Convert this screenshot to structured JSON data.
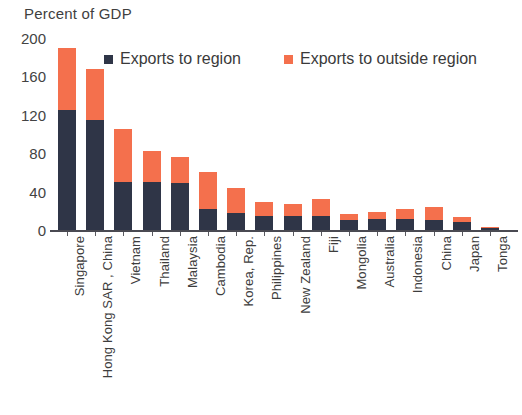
{
  "chart_data": {
    "type": "bar",
    "subtype": "stacked-vertical",
    "title": "",
    "ylabel": "Percent of GDP",
    "xlabel": "",
    "ylim": [
      0,
      200
    ],
    "yticks": [
      0,
      40,
      80,
      120,
      160,
      200
    ],
    "ytick_labels": [
      "0",
      "40",
      "80",
      "120",
      "160",
      "200"
    ],
    "grid": false,
    "legend_position": "top-center",
    "categories": [
      "Singapore",
      "Hong Kong SAR , China",
      "Vietnam",
      "Thailand",
      "Malaysia",
      "Cambodia",
      "Korea, Rep.",
      "Philippines",
      "New Zealand",
      "Fiji",
      "Mongolia",
      "Australia",
      "Indonesia",
      "China",
      "Japan",
      "Tonga"
    ],
    "series": [
      {
        "name": "Exports to region",
        "color": "#2f3547",
        "values": [
          125,
          115,
          50,
          50,
          49,
          22,
          18,
          15,
          15,
          15,
          10,
          11,
          11,
          10,
          8,
          2
        ]
      },
      {
        "name": "Exports to outside region",
        "color": "#f4704d",
        "values": [
          65,
          53,
          55,
          32,
          27,
          38,
          26,
          14,
          12,
          17,
          7,
          8,
          11,
          14,
          6,
          1
        ]
      }
    ],
    "totals": [
      190,
      168,
      105,
      82,
      76,
      60,
      44,
      29,
      27,
      32,
      17,
      19,
      22,
      24,
      14,
      3
    ]
  },
  "legend": {
    "items": [
      {
        "label": "Exports to region",
        "color": "#2f3547"
      },
      {
        "label": "Exports to outside region",
        "color": "#f4704d"
      }
    ]
  }
}
